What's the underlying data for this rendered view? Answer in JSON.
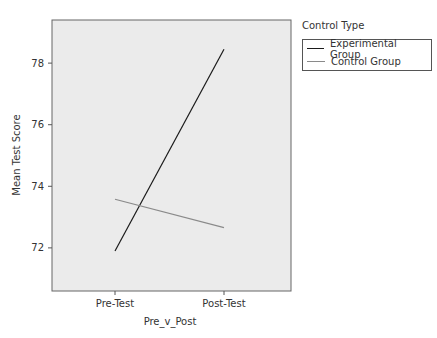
{
  "chart_data": {
    "type": "line",
    "title": "",
    "xlabel": "Pre_v_Post",
    "ylabel": "Mean Test Score",
    "categories": [
      "Pre-Test",
      "Post-Test"
    ],
    "series": [
      {
        "name": "Experimental Group",
        "color": "#1a1a1a",
        "values": [
          71.9,
          78.45
        ]
      },
      {
        "name": "Control Group",
        "color": "#8a8a8a",
        "values": [
          73.58,
          72.66
        ]
      }
    ],
    "ylim": [
      70.6,
      79.4
    ],
    "yticks": [
      72,
      74,
      76,
      78
    ],
    "grid": false,
    "legend_title": "Control Type",
    "legend_position": "right",
    "plot_background": "#ebebeb"
  }
}
